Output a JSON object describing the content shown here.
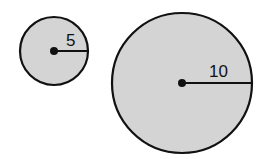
{
  "circles": [
    {
      "name": "small-circle",
      "radius_label": "5",
      "cx": 54,
      "cy": 51,
      "r": 35
    },
    {
      "name": "large-circle",
      "radius_label": "10",
      "cx": 182,
      "cy": 83,
      "r": 70
    }
  ],
  "colors": {
    "fill": "#d4d4d4",
    "stroke": "#111111"
  }
}
